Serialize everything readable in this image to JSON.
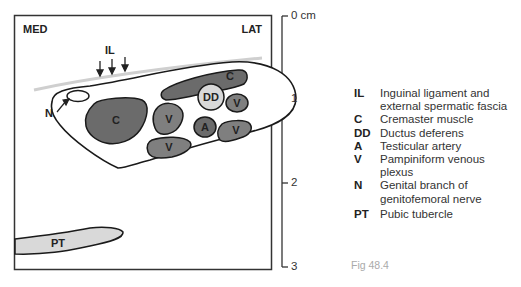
{
  "diagram": {
    "orientation": {
      "medial": "MED",
      "lateral": "LAT"
    },
    "structure_labels": {
      "inguinal_ligament": "IL",
      "nerve": "N",
      "cremaster_large": "C",
      "cremaster_small": "C",
      "ductus_deferens": "DD",
      "artery": "A",
      "vein_left": "V",
      "vein_right_upper": "V",
      "vein_right_lower": "V",
      "vein_bottom": "V",
      "pubic_tubercle": "PT"
    },
    "colors": {
      "dark_fill": "#6b6b6b",
      "medium_fill": "#7f7f7f",
      "light_fill": "#d9d9d9",
      "outline": "#1a1a1a",
      "fascia_line": "#cfcfcf"
    }
  },
  "scale": {
    "ticks": [
      {
        "label": "0 cm"
      },
      {
        "label": "1"
      },
      {
        "label": "2"
      },
      {
        "label": "3"
      }
    ]
  },
  "legend": {
    "items": [
      {
        "abbr": "IL",
        "desc": "Inguinal ligament and\nexternal spermatic fascia"
      },
      {
        "abbr": "C",
        "desc": "Cremaster muscle"
      },
      {
        "abbr": "DD",
        "desc": "Ductus deferens"
      },
      {
        "abbr": "A",
        "desc": "Testicular artery"
      },
      {
        "abbr": "V",
        "desc": "Pampiniform venous plexus"
      },
      {
        "abbr": "N",
        "desc": "Genital branch of\ngenitofemoral nerve"
      },
      {
        "abbr": "PT",
        "desc": "Pubic tubercle"
      }
    ]
  },
  "figure_label": "Fig 48.4"
}
